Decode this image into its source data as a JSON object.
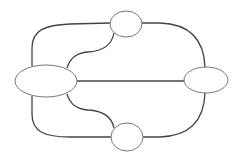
{
  "diagram": {
    "type": "graph",
    "colors": {
      "edge": "#444444",
      "node_stroke": "#777777",
      "node_fill": "#ffffff",
      "background": "#ffffff"
    },
    "nodes": [
      {
        "id": "left",
        "label": "",
        "cx": 46,
        "cy": 81,
        "rx": 31,
        "ry": 16
      },
      {
        "id": "top",
        "label": "",
        "cx": 126,
        "cy": 24,
        "rx": 16,
        "ry": 13
      },
      {
        "id": "right",
        "label": "",
        "cx": 206,
        "cy": 80,
        "rx": 22,
        "ry": 13
      },
      {
        "id": "bottom",
        "label": "",
        "cx": 127,
        "cy": 137,
        "rx": 16,
        "ry": 14
      }
    ],
    "edges": [
      {
        "from": "left",
        "to": "top",
        "route": "outer"
      },
      {
        "from": "left",
        "to": "top",
        "route": "inner"
      },
      {
        "from": "left",
        "to": "bottom",
        "route": "outer"
      },
      {
        "from": "left",
        "to": "bottom",
        "route": "inner"
      },
      {
        "from": "left",
        "to": "right",
        "route": "straight"
      },
      {
        "from": "top",
        "to": "right",
        "route": "curve"
      },
      {
        "from": "bottom",
        "to": "right",
        "route": "curve"
      }
    ]
  }
}
